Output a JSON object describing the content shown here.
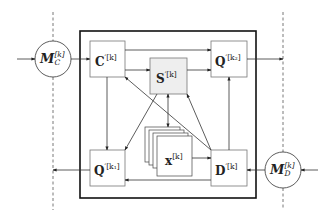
{
  "diagram": {
    "type": "block-diagram",
    "nodes": {
      "mc": {
        "symbol": "M",
        "sub": "C",
        "sup": "[k]",
        "shape": "circle"
      },
      "md": {
        "symbol": "M",
        "sub": "D",
        "sup": "[k]",
        "shape": "circle"
      },
      "c": {
        "symbol": "C",
        "sup": "′[k]",
        "shape": "box"
      },
      "s": {
        "symbol": "S",
        "sup": "′[k]",
        "shape": "box",
        "fill": "#eeeeee"
      },
      "q2": {
        "symbol": "Q",
        "sup": "′[k₂]",
        "shape": "box"
      },
      "q1": {
        "symbol": "Q",
        "sup": "′[k₁]",
        "shape": "box"
      },
      "d": {
        "symbol": "D",
        "sup": "′[k]",
        "shape": "box"
      },
      "x": {
        "symbol": "x",
        "sup": "[k]",
        "shape": "stacked-boxes"
      }
    },
    "edges": [
      {
        "from": "input-left",
        "to": "mc"
      },
      {
        "from": "mc",
        "to": "c"
      },
      {
        "from": "c",
        "to": "q2"
      },
      {
        "from": "c",
        "to": "s"
      },
      {
        "from": "c",
        "to": "q1"
      },
      {
        "from": "c",
        "to": "d"
      },
      {
        "from": "s",
        "to": "q2"
      },
      {
        "from": "s",
        "to": "x",
        "bidirectional": true
      },
      {
        "from": "s",
        "to": "q1"
      },
      {
        "from": "d",
        "to": "c"
      },
      {
        "from": "d",
        "to": "q2"
      },
      {
        "from": "d",
        "to": "s"
      },
      {
        "from": "x",
        "to": "d"
      },
      {
        "from": "d",
        "to": "q1"
      },
      {
        "from": "q2",
        "to": "output-right"
      },
      {
        "from": "q1",
        "to": "output-left"
      },
      {
        "from": "input-right",
        "to": "md"
      },
      {
        "from": "md",
        "to": "d"
      }
    ],
    "colors": {
      "stroke": "#333333",
      "frame": "#111111",
      "s_fill": "#eeeeee",
      "dashed": "#555555"
    }
  }
}
